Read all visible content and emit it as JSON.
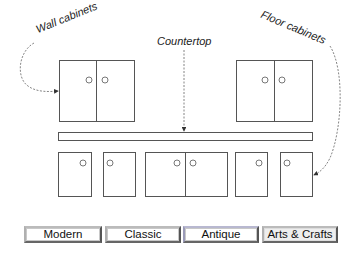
{
  "labels": {
    "wall_cabinets": "Wall cabinets",
    "countertop": "Countertop",
    "floor_cabinets": "Floor cabinets"
  },
  "style_buttons": [
    {
      "label": "Modern",
      "bg": "#ffffff",
      "border": "#8a8a8a"
    },
    {
      "label": "Classic",
      "bg": "#ffffff",
      "border": "#8a8a8a"
    },
    {
      "label": "Antique",
      "bg": "#ffffff",
      "border": "#9a9ab8"
    },
    {
      "label": "Arts & Crafts",
      "bg": "#eeeeee",
      "border": "#8a8a8a"
    }
  ],
  "colors": {
    "line": "#555555",
    "text": "#222222"
  }
}
